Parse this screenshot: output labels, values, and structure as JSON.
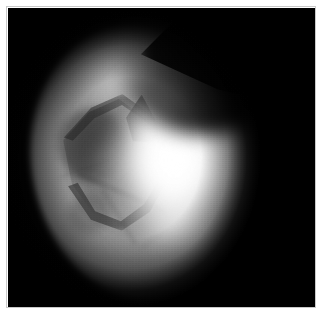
{
  "image": {
    "title": "Endoscopic grayscale frame",
    "modality": "endoscopy",
    "color_mode": "grayscale",
    "width_px": 326,
    "height_px": 320,
    "alt_text": "Grayscale endoscopic view of an illuminated oval tissue field with a bright specular highlight on the right side, a dark angular structure at left, and a dark diagonal shadow band across the upper right.",
    "background_color": "#020202",
    "frame_border_color": "#c9c9c9",
    "page_background_color": "#ffffff"
  },
  "plate": {
    "left_px": 8,
    "top_px": 8,
    "width_px": 307,
    "height_px": 299,
    "fill_color": "#020202"
  },
  "regions": {
    "tissue_field": {
      "label": "illuminated oval tissue field",
      "tone": "mid gray",
      "color": "#949494"
    },
    "bright_lobe": {
      "label": "diffuse bright lobe",
      "tone": "near white",
      "color": "#f5f5f5"
    },
    "specular_core": {
      "label": "specular highlight core",
      "tone": "white",
      "color": "#ffffff"
    },
    "lower_glow": {
      "label": "secondary lower glow",
      "tone": "light gray",
      "color": "#e6e6e6"
    },
    "upper_pale": {
      "label": "upper left pale band",
      "tone": "light gray",
      "color": "#cfcfcf"
    },
    "dark_band": {
      "label": "dark diagonal shadow band, upper right",
      "tone": "near black",
      "color": "#0a0a0a"
    },
    "dark_wedge": {
      "label": "dark wedge notch at top center",
      "tone": "black",
      "color": "#000000"
    },
    "dark_polygon": {
      "label": "dark angular polygonal structure, left of center",
      "tone": "dark gray",
      "color": "#3a3a3a"
    },
    "dark_peak": {
      "label": "dark pointed peak",
      "tone": "dark gray",
      "color": "#1c1c1c"
    },
    "polygon_interior": {
      "label": "lighter interior patch within polygon",
      "tone": "gray",
      "color": "#b2b2b2"
    },
    "seams": {
      "label": "faint diagonal tissue seams",
      "tone": "dark streaks",
      "color": "#2d2d2d",
      "count": 4
    },
    "vignette": {
      "label": "edge vignette falloff",
      "tone": "black",
      "color": "#000000"
    }
  }
}
